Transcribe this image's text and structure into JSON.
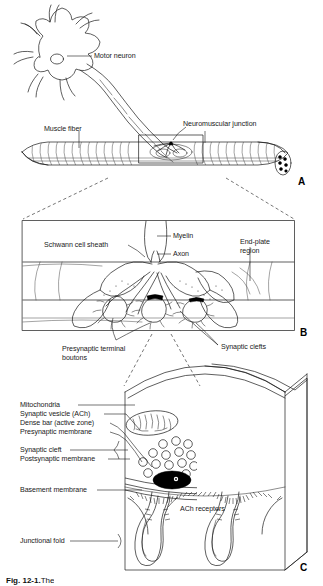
{
  "figure": {
    "caption_number": "Fig. 12-1.",
    "caption_text": "The",
    "panels": [
      "A",
      "B",
      "C"
    ]
  },
  "panel_a": {
    "letter": "A",
    "labels": {
      "motor_neuron": "Motor neuron",
      "muscle_fiber": "Muscle fiber",
      "neuromuscular_junction": "Neuromuscular junction"
    }
  },
  "panel_b": {
    "letter": "B",
    "labels": {
      "schwann_cell_sheath": "Schwann cell sheath",
      "myelin": "Myelin",
      "axon": "Axon",
      "end_plate_region_line1": "End-plate",
      "end_plate_region_line2": "region",
      "presynaptic_terminal_line1": "Presynaptic terminal",
      "presynaptic_terminal_line2": "boutons",
      "synaptic_clefts": "Synaptic clefts"
    }
  },
  "panel_c": {
    "letter": "C",
    "labels": {
      "mitochondria": "Mitochondria",
      "synaptic_vesicle": "Synaptic vesicle (ACh)",
      "dense_bar": "Dense bar (active zone)",
      "presynaptic_membrane": "Presynaptic membrane",
      "synaptic_cleft": "Synaptic cleft",
      "postsynaptic_membrane": "Postsynaptic membrane",
      "basement_membrane": "Basement membrane",
      "junctional_fold": "Junctional fold",
      "ach_receptors": "ACh receptors"
    }
  },
  "style": {
    "ink": "#1a1a1a",
    "background": "#ffffff",
    "dense_bar_fill": "#000000"
  }
}
